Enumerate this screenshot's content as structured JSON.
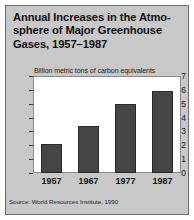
{
  "figure": {
    "title_lines": [
      "Annual Increases in the Atmo-",
      "sphere of Major Greenhouse",
      "Gases, 1957–1987"
    ],
    "title_full": "Annual Increases in the Atmosphere of Major Greenhouse Gases, 1957–1987",
    "source": "Source: World Resources Institute, 1990",
    "background_color": "#c8c8c8",
    "plot_background_color": "#ffffff",
    "bar_color": "#454545",
    "axis_color": "#3a3a3a"
  },
  "chart_data": {
    "type": "bar",
    "subtitle": "Billion metric tons of carbon equivalents",
    "xlabel": "",
    "ylabel": "Billion metric tons of carbon equivalents",
    "categories": [
      "1957",
      "1967",
      "1977",
      "1987"
    ],
    "values": [
      2.1,
      3.4,
      5.0,
      5.9
    ],
    "ylim": [
      0,
      7
    ],
    "yticks": [
      0,
      1,
      2,
      3,
      4,
      5,
      6,
      7
    ],
    "ytick_labels": [
      "0",
      "1",
      "2",
      "3",
      "4",
      "5",
      "6",
      "7"
    ],
    "grid": false,
    "legend": null,
    "legend_position": "none"
  }
}
